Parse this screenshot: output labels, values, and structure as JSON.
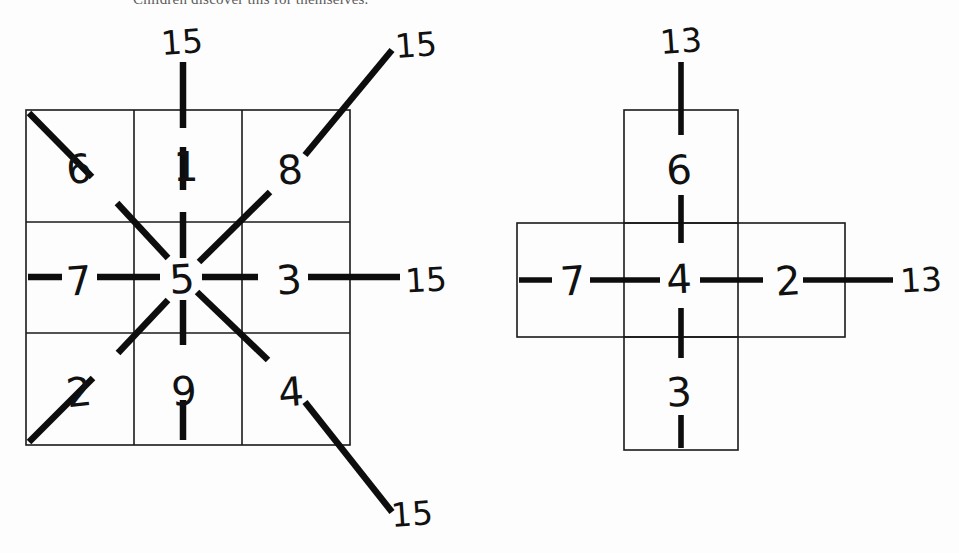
{
  "page": {
    "background_color": "#fdfdfd",
    "ink_color": "#111111",
    "clipped_caption": "Children discover this for themselves."
  },
  "figures": [
    {
      "id": "magic-square-3x3",
      "name": "3 by 3 magic square",
      "shape": "square-grid",
      "rows": 3,
      "cols": 3,
      "grid": [
        [
          6,
          1,
          8
        ],
        [
          7,
          5,
          3
        ],
        [
          2,
          9,
          4
        ]
      ],
      "visible_cells": [
        {
          "name": "cell-top-left",
          "value": "6",
          "row": 0,
          "col": 0
        },
        {
          "name": "cell-top-center",
          "value": "1",
          "row": 0,
          "col": 1
        },
        {
          "name": "cell-top-right",
          "value": "8",
          "row": 0,
          "col": 2
        },
        {
          "name": "cell-middle-left",
          "value": "7",
          "row": 1,
          "col": 0
        },
        {
          "name": "cell-middle-center",
          "value": "5",
          "row": 1,
          "col": 1
        },
        {
          "name": "cell-middle-right",
          "value": "3",
          "row": 1,
          "col": 2
        },
        {
          "name": "cell-bottom-left",
          "value": "2",
          "row": 2,
          "col": 0
        },
        {
          "name": "cell-bottom-center",
          "value": "9",
          "row": 2,
          "col": 1
        },
        {
          "name": "cell-bottom-right",
          "value": "4",
          "row": 2,
          "col": 2
        }
      ],
      "sums": [
        {
          "name": "sum-top-column",
          "value": "15",
          "position": "top"
        },
        {
          "name": "sum-anti-diagonal",
          "value": "15",
          "position": "top-right"
        },
        {
          "name": "sum-middle-row",
          "value": "15",
          "position": "right"
        },
        {
          "name": "sum-main-diagonal",
          "value": "15",
          "position": "bottom-right"
        }
      ],
      "magic_constant": "15"
    },
    {
      "id": "magic-cross",
      "name": "plus shaped magic cross",
      "shape": "cross",
      "visible_cells": [
        {
          "name": "cell-top",
          "value": "6",
          "position": "top"
        },
        {
          "name": "cell-left",
          "value": "7",
          "position": "left"
        },
        {
          "name": "cell-center",
          "value": "4",
          "position": "center"
        },
        {
          "name": "cell-right",
          "value": "2",
          "position": "right"
        },
        {
          "name": "cell-bottom",
          "value": "3",
          "position": "bottom"
        }
      ],
      "sums": [
        {
          "name": "sum-vertical",
          "value": "13",
          "position": "top"
        },
        {
          "name": "sum-horizontal",
          "value": "13",
          "position": "right"
        }
      ],
      "magic_constant": "13"
    }
  ]
}
